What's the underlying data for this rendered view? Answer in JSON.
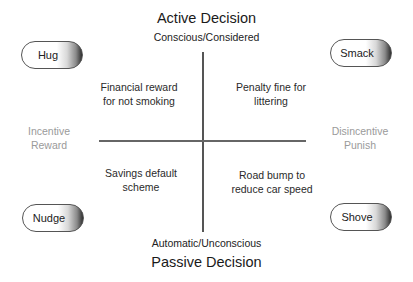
{
  "diagram": {
    "top": {
      "title": "Active Decision",
      "subtitle": "Conscious/Considered"
    },
    "bottom": {
      "title": "Passive Decision",
      "subtitle": "Automatic/Unconscious"
    },
    "left": {
      "line1": "Incentive",
      "line2": "Reward"
    },
    "right": {
      "line1": "Disincentive",
      "line2": "Punish"
    },
    "quadrants": {
      "top_left": {
        "line1": "Financial reward",
        "line2": "for not smoking"
      },
      "top_right": {
        "line1": "Penalty fine for",
        "line2": "littering"
      },
      "bottom_left": {
        "line1": "Savings default",
        "line2": "scheme"
      },
      "bottom_right": {
        "line1": "Road bump to",
        "line2": "reduce car speed"
      }
    },
    "pills": {
      "top_left": "Hug",
      "top_right": "Smack",
      "bottom_left": "Nudge",
      "bottom_right": "Shove"
    }
  }
}
